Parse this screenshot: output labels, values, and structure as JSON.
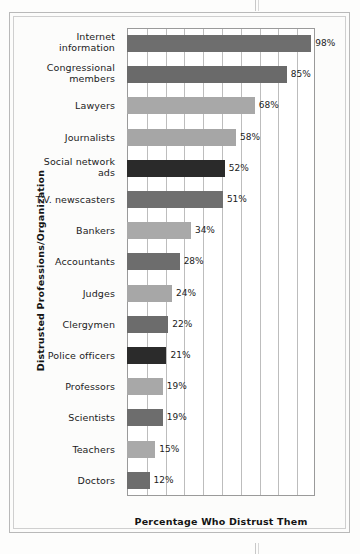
{
  "chart_data": {
    "type": "bar",
    "orientation": "horizontal",
    "title": "",
    "xlabel": "Percentage Who Distrust Them",
    "ylabel": "Distrusted Professions/Organization",
    "xlim": [
      0,
      100
    ],
    "xtick_interval": 10,
    "grid": "vertical",
    "legend": "none",
    "value_suffix": "%",
    "categories": [
      "Internet information",
      "Congressional members",
      "Lawyers",
      "Journalists",
      "Social network ads",
      "T.V. newscasters",
      "Bankers",
      "Accountants",
      "Judges",
      "Clergymen",
      "Police officers",
      "Professors",
      "Scientists",
      "Teachers",
      "Doctors"
    ],
    "values": [
      98,
      85,
      68,
      58,
      52,
      51,
      34,
      28,
      24,
      22,
      21,
      19,
      19,
      15,
      12
    ],
    "bars": [
      {
        "label_line1": "Internet",
        "label_line2": "information",
        "value": 98,
        "value_text": "98%",
        "color": "#6e6e6e"
      },
      {
        "label_line1": "Congressional",
        "label_line2": "members",
        "value": 85,
        "value_text": "85%",
        "color": "#6a6a6a"
      },
      {
        "label_line1": "Lawyers",
        "label_line2": "",
        "value": 68,
        "value_text": "68%",
        "color": "#a8a8a8"
      },
      {
        "label_line1": "Journalists",
        "label_line2": "",
        "value": 58,
        "value_text": "58%",
        "color": "#a6a6a6"
      },
      {
        "label_line1": "Social network",
        "label_line2": "ads",
        "value": 52,
        "value_text": "52%",
        "color": "#2a2a2a"
      },
      {
        "label_line1": "T.V. newscasters",
        "label_line2": "",
        "value": 51,
        "value_text": "51%",
        "color": "#6f6f6f"
      },
      {
        "label_line1": "Bankers",
        "label_line2": "",
        "value": 34,
        "value_text": "34%",
        "color": "#a9a9a9"
      },
      {
        "label_line1": "Accountants",
        "label_line2": "",
        "value": 28,
        "value_text": "28%",
        "color": "#6d6d6d"
      },
      {
        "label_line1": "Judges",
        "label_line2": "",
        "value": 24,
        "value_text": "24%",
        "color": "#a7a7a7"
      },
      {
        "label_line1": "Clergymen",
        "label_line2": "",
        "value": 22,
        "value_text": "22%",
        "color": "#6c6c6c"
      },
      {
        "label_line1": "Police officers",
        "label_line2": "",
        "value": 21,
        "value_text": "21%",
        "color": "#2b2b2b"
      },
      {
        "label_line1": "Professors",
        "label_line2": "",
        "value": 19,
        "value_text": "19%",
        "color": "#a8a8a8"
      },
      {
        "label_line1": "Scientists",
        "label_line2": "",
        "value": 19,
        "value_text": "19%",
        "color": "#6d6d6d"
      },
      {
        "label_line1": "Teachers",
        "label_line2": "",
        "value": 15,
        "value_text": "15%",
        "color": "#a9a9a9"
      },
      {
        "label_line1": "Doctors",
        "label_line2": "",
        "value": 12,
        "value_text": "12%",
        "color": "#6d6d6d"
      }
    ],
    "colors": {
      "plot_background": "#ffffff",
      "page_background": "#fdfdfc",
      "gridline": "#bdbdbd",
      "axis_line": "#9a9a9a",
      "text": "#1b1b1b",
      "frame_outer": "#b9b9b9",
      "frame_inner": "#cfcfcf"
    }
  }
}
